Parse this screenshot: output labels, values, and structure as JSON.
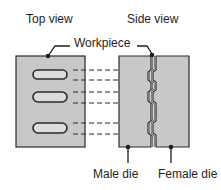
{
  "labels": {
    "top_view": "Top view",
    "side_view": "Side view",
    "workpiece": "Workpiece",
    "male_die": "Male die",
    "female_die": "Female die"
  },
  "colors": {
    "fill": "#c8c8c8",
    "stroke": "#2a2a2a",
    "slot_fill": "#dcdcdc",
    "background": "#ffffff"
  }
}
